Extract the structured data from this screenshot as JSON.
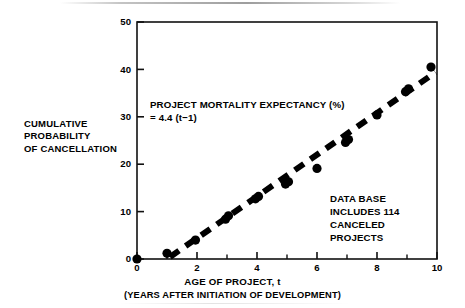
{
  "chart_data": {
    "type": "scatter",
    "title": "",
    "xlabel": "AGE OF PROJECT, t",
    "xsublabel": "(YEARS AFTER INITIATION OF DEVELOPMENT)",
    "ylabel_lines": [
      "CUMULATIVE",
      "PROBABILITY",
      "OF CANCELLATION"
    ],
    "xlim": [
      0,
      10
    ],
    "ylim": [
      0,
      50
    ],
    "xticks": [
      0,
      2,
      4,
      6,
      8,
      10
    ],
    "xtick_labels": [
      "0",
      "2",
      "4",
      "6",
      "8",
      "10"
    ],
    "xminor_ticks": [
      1,
      3,
      5,
      7,
      9
    ],
    "yticks": [
      0,
      10,
      20,
      30,
      40,
      50
    ],
    "ytick_labels": [
      "0",
      "10",
      "20",
      "30",
      "40",
      "50"
    ],
    "grid": false,
    "legend": "none",
    "series": [
      {
        "name": "Canceled projects (observed cumulative probability)",
        "marker": "filled-circle",
        "color": "#000000",
        "points": [
          {
            "x": 0.0,
            "y": 0.0
          },
          {
            "x": 1.0,
            "y": 1.2
          },
          {
            "x": 1.95,
            "y": 4.0
          },
          {
            "x": 2.95,
            "y": 8.4
          },
          {
            "x": 3.05,
            "y": 9.1
          },
          {
            "x": 3.95,
            "y": 12.7
          },
          {
            "x": 4.05,
            "y": 13.2
          },
          {
            "x": 4.95,
            "y": 15.8
          },
          {
            "x": 5.05,
            "y": 16.3
          },
          {
            "x": 6.0,
            "y": 19.1
          },
          {
            "x": 6.95,
            "y": 24.6
          },
          {
            "x": 7.05,
            "y": 25.2
          },
          {
            "x": 8.0,
            "y": 30.4
          },
          {
            "x": 8.95,
            "y": 35.3
          },
          {
            "x": 9.05,
            "y": 35.9
          },
          {
            "x": 9.8,
            "y": 40.5
          }
        ]
      },
      {
        "name": "Project mortality expectancy trend line",
        "style": "dashed",
        "color": "#000000",
        "equation": "y = 4.4 (t - 1)",
        "slope": 4.4,
        "intercept_t": 1.0,
        "x_start": 1.1,
        "x_end": 9.95,
        "y_start": 0.44,
        "y_end": 39.38
      }
    ],
    "annotations": [
      {
        "name": "formula",
        "lines": [
          "PROJECT MORTALITY EXPECTANCY (%)",
          "= 4.4 (t−1)"
        ],
        "x": 1.5,
        "y": 33
      },
      {
        "name": "database-note",
        "lines": [
          "DATA BASE",
          "INCLUDES 114",
          "CANCELED",
          "PROJECTS"
        ],
        "x": 6.6,
        "y": 14
      }
    ]
  },
  "axis": {
    "y_title_line_1": "CUMULATIVE",
    "y_title_line_2": "PROBABILITY",
    "y_title_line_3": "OF CANCELLATION",
    "x_title": "AGE OF PROJECT, t",
    "x_subtitle": "(YEARS AFTER INITIATION OF DEVELOPMENT)",
    "y_tick_0": "0",
    "y_tick_10": "10",
    "y_tick_20": "20",
    "y_tick_30": "30",
    "y_tick_40": "40",
    "y_tick_50": "50",
    "x_tick_0": "0",
    "x_tick_2": "2",
    "x_tick_4": "4",
    "x_tick_6": "6",
    "x_tick_8": "8",
    "x_tick_10": "10"
  },
  "annotations": {
    "formula_line_1": "PROJECT MORTALITY EXPECTANCY (%)",
    "formula_line_2": "= 4.4 (t−1)",
    "database_line_1": "DATA BASE",
    "database_line_2": "INCLUDES 114",
    "database_line_3": "CANCELED",
    "database_line_4": "PROJECTS"
  },
  "colors": {
    "background": "#ffffff",
    "ink": "#000000",
    "axis": "#1a1a1a"
  }
}
